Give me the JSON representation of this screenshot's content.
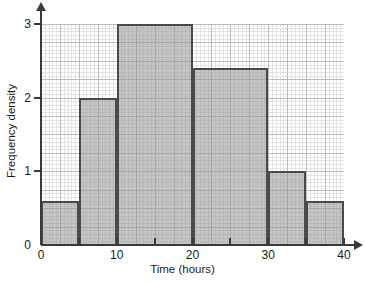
{
  "chart_data": {
    "type": "bar",
    "title": "",
    "xlabel": "Time (hours)",
    "ylabel": "Frequency density",
    "xlim": [
      0,
      40
    ],
    "ylim": [
      0,
      3
    ],
    "grid": true,
    "legend": "none",
    "xticklabels": [
      "0",
      "10",
      "20",
      "30",
      "40"
    ],
    "xtickvalues": [
      0,
      10,
      20,
      30,
      40
    ],
    "xminortickvalues": [
      5,
      15,
      25,
      35
    ],
    "yticklabels": [
      "0",
      "1",
      "2",
      "3"
    ],
    "ytickvalues": [
      0,
      1,
      2,
      3
    ],
    "bar_color": "#969696",
    "bar_edge_color": "#4a4a4a",
    "bins": [
      {
        "label": "0-5",
        "x0": 0,
        "x1": 5,
        "value": 0.6
      },
      {
        "label": "5-10",
        "x0": 5,
        "x1": 10,
        "value": 2.0
      },
      {
        "label": "10-20",
        "x0": 10,
        "x1": 20,
        "value": 3.0
      },
      {
        "label": "20-30",
        "x0": 20,
        "x1": 30,
        "value": 2.4
      },
      {
        "label": "30-35",
        "x0": 30,
        "x1": 35,
        "value": 1.0
      },
      {
        "label": "35-40",
        "x0": 35,
        "x1": 40,
        "value": 0.6
      }
    ]
  }
}
